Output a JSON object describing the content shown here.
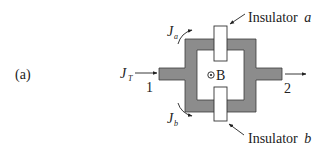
{
  "figure": {
    "panel_label": "(a)",
    "magnetic_field_label": "B",
    "magnetic_field_symbol": "out-of-page (dot in circle)",
    "terminals": {
      "input": "1",
      "output": "2"
    },
    "currents": {
      "total": {
        "symbol": "J",
        "subscript": "T"
      },
      "branch_a": {
        "symbol": "J",
        "subscript": "a"
      },
      "branch_b": {
        "symbol": "J",
        "subscript": "b"
      }
    },
    "insulators": {
      "a": {
        "word": "Insulator",
        "letter": "a"
      },
      "b": {
        "word": "Insulator",
        "letter": "b"
      }
    },
    "colors": {
      "conductor_fill": "#8c8c8c",
      "conductor_stroke": "#3a3a3a",
      "insulator_fill": "#ffffff",
      "line": "#222222",
      "background": "#ffffff"
    }
  }
}
